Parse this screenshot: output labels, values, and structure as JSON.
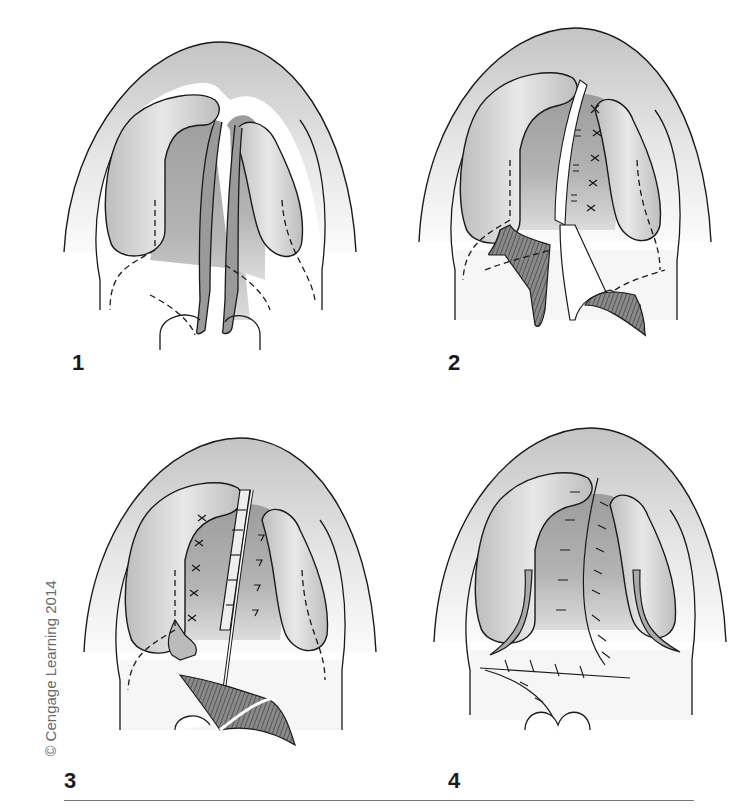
{
  "figure": {
    "panels": [
      {
        "number": "1"
      },
      {
        "number": "2"
      },
      {
        "number": "3"
      },
      {
        "number": "4"
      }
    ],
    "copyright": "© Cengage Learning 2014",
    "colors": {
      "outline": "#1a1a1a",
      "palate_shade": "#b8b8b8",
      "ridge_fill": "#c8c8c8",
      "background_fade": "#f4f4f4",
      "muscle_hatch": "#555555"
    }
  }
}
